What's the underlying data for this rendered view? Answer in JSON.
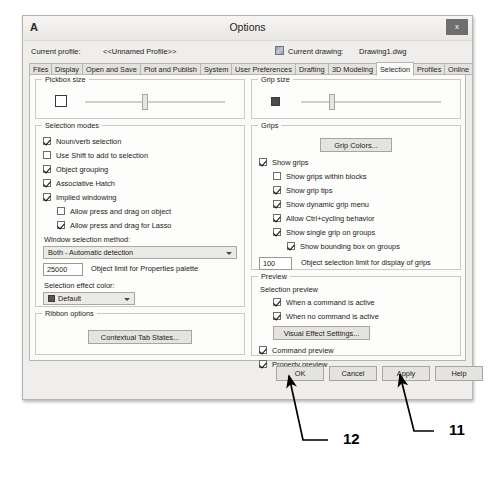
{
  "window": {
    "app_glyph": "A",
    "title": "Options",
    "close_label": "x"
  },
  "header": {
    "profile_label": "Current profile:",
    "profile_value": "<<Unnamed Profile>>",
    "drawing_icon": "drawing-icon",
    "drawing_label": "Current drawing:",
    "drawing_value": "Drawing1.dwg"
  },
  "tabs": [
    {
      "label": "Files",
      "active": false
    },
    {
      "label": "Display",
      "active": false
    },
    {
      "label": "Open and Save",
      "active": false
    },
    {
      "label": "Plot and Publish",
      "active": false
    },
    {
      "label": "System",
      "active": false
    },
    {
      "label": "User Preferences",
      "active": false
    },
    {
      "label": "Drafting",
      "active": false
    },
    {
      "label": "3D Modeling",
      "active": false
    },
    {
      "label": "Selection",
      "active": true
    },
    {
      "label": "Profiles",
      "active": false
    },
    {
      "label": "Online",
      "active": false
    }
  ],
  "pickbox": {
    "legend": "Pickbox size",
    "slider_percent": 43
  },
  "gripsize": {
    "legend": "Grip size",
    "slider_percent": 22
  },
  "selection_modes": {
    "legend": "Selection modes",
    "items": [
      {
        "label": "Noun/verb selection",
        "checked": true,
        "indent": 0
      },
      {
        "label": "Use Shift to add to selection",
        "checked": false,
        "indent": 0
      },
      {
        "label": "Object grouping",
        "checked": true,
        "indent": 0
      },
      {
        "label": "Associative Hatch",
        "checked": true,
        "indent": 0
      },
      {
        "label": "Implied windowing",
        "checked": true,
        "indent": 0
      },
      {
        "label": "Allow press and drag on object",
        "checked": false,
        "indent": 1
      },
      {
        "label": "Allow press and drag for Lasso",
        "checked": true,
        "indent": 1
      }
    ],
    "window_method_label": "Window selection method:",
    "window_method_value": "Both - Automatic detection",
    "object_limit_value": "25000",
    "object_limit_label": "Object limit for Properties palette",
    "effect_color_label": "Selection effect color:",
    "effect_color_value": "Default"
  },
  "ribbon_options": {
    "legend": "Ribbon options",
    "contextual_button": "Contextual Tab States..."
  },
  "grips": {
    "legend": "Grips",
    "grip_colors_button": "Grip Colors...",
    "items": [
      {
        "label": "Show grips",
        "checked": true,
        "indent": 0
      },
      {
        "label": "Show grips within blocks",
        "checked": false,
        "indent": 1
      },
      {
        "label": "Show grip tips",
        "checked": true,
        "indent": 1
      },
      {
        "label": "Show dynamic grip menu",
        "checked": true,
        "indent": 1
      },
      {
        "label": "Allow Ctrl+cycling behavior",
        "checked": true,
        "indent": 1
      },
      {
        "label": "Show single grip on groups",
        "checked": true,
        "indent": 1
      },
      {
        "label": "Show bounding box on groups",
        "checked": true,
        "indent": 2
      }
    ],
    "grip_limit_value": "100",
    "grip_limit_label": "Object selection limit for display of grips"
  },
  "preview": {
    "legend": "Preview",
    "selection_preview_label": "Selection preview",
    "items": [
      {
        "label": "When a command is active",
        "checked": true,
        "indent": 1
      },
      {
        "label": "When no command is active",
        "checked": true,
        "indent": 1
      }
    ],
    "visual_effect_button": "Visual Effect Settings...",
    "items2": [
      {
        "label": "Command preview",
        "checked": true
      },
      {
        "label": "Property preview",
        "checked": true
      }
    ]
  },
  "footer": {
    "ok": "OK",
    "cancel": "Cancel",
    "apply": "Apply",
    "help": "Help"
  },
  "annotations": [
    {
      "number": "12",
      "target": "ok-button"
    },
    {
      "number": "11",
      "target": "apply-button"
    }
  ]
}
